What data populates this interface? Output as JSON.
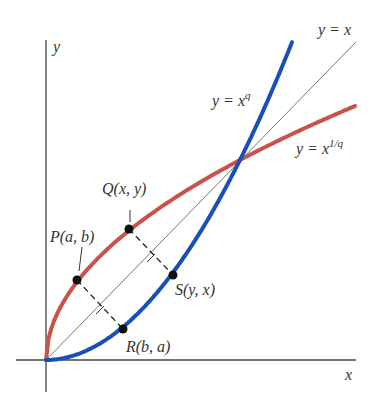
{
  "figure": {
    "axes": {
      "x_label": "x",
      "y_label": "y"
    },
    "curves": {
      "identity": {
        "label": "y = x",
        "color": "#555555"
      },
      "power": {
        "label_base": "y = x",
        "label_exp": "q",
        "color": "#1a4fb8"
      },
      "root": {
        "label_base": "y = x",
        "label_exp": "1/q",
        "color": "#c9524a"
      }
    },
    "points": {
      "P": {
        "label": "P(a, b)"
      },
      "Q": {
        "label": "Q(x, y)"
      },
      "R": {
        "label": "R(b, a)"
      },
      "S": {
        "label": "S(y, x)"
      }
    }
  }
}
